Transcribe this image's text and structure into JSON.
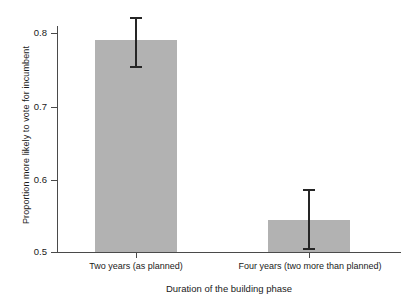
{
  "chart_data": {
    "type": "bar",
    "title": "",
    "subtitle": "",
    "xlabel": "Duration of the building phase",
    "ylabel": "Proportion more likely to vote for incumbent",
    "categories": [
      "Two years (as planned)",
      "Four years (two more than planned)"
    ],
    "values": [
      0.79,
      0.544
    ],
    "error_low": [
      0.752,
      0.503
    ],
    "error_high": [
      0.822,
      0.586
    ],
    "ylim": [
      0.5,
      0.82
    ],
    "yticks": [
      0.5,
      0.6,
      0.7,
      0.8
    ],
    "ytick_labels": [
      "0.5",
      "0.6",
      "0.7",
      "0.8"
    ],
    "grid": false,
    "legend": null,
    "bar_color": "#b2b2b2",
    "error_color": "#262626",
    "axis_color": "#4a4a4a",
    "background": "#ffffff"
  },
  "axes": {
    "y_label": "Proportion more likely to vote for incumbent",
    "x_label": "Duration of the building phase",
    "y_ticks": [
      {
        "label": "0.8",
        "value": 0.8
      },
      {
        "label": "0.7",
        "value": 0.7
      },
      {
        "label": "0.6",
        "value": 0.6
      },
      {
        "label": "0.5",
        "value": 0.5
      }
    ],
    "x_ticks": [
      {
        "label": "Two years (as planned)"
      },
      {
        "label": "Four years (two more than planned)"
      }
    ]
  }
}
